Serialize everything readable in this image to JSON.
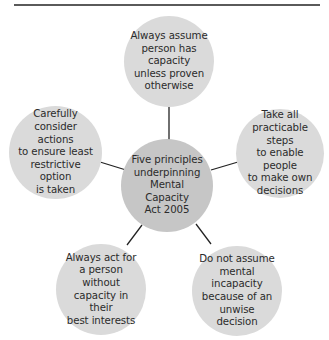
{
  "diagram": {
    "title": "",
    "colors": {
      "outer_node": "#dadada",
      "center_node": "#c6c6c6",
      "connector": "#222222",
      "top_rule": "#5a5a5a",
      "text": "#2b2b2b"
    },
    "center": {
      "label": "Five principles\nunderpinning\nMental Capacity\nAct 2005"
    },
    "principles": [
      {
        "id": "top",
        "label": "Always assume\nperson has capacity\nunless proven\notherwise"
      },
      {
        "id": "right",
        "label": "Take all\npracticable steps\nto enable people\nto make own\ndecisions"
      },
      {
        "id": "bottom-right",
        "label": "Do not assume\nmental incapacity\nbecause of an\nunwise decision"
      },
      {
        "id": "bottom-left",
        "label": "Always act for\na person without\ncapacity in their\nbest interests"
      },
      {
        "id": "left",
        "label": "Carefully\nconsider actions\nto ensure least\nrestrictive option\nis taken"
      }
    ]
  }
}
